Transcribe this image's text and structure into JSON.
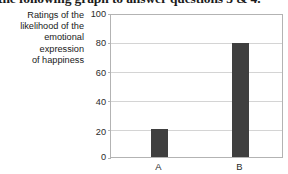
{
  "header": {
    "clipped_text": "the following graph to answer questions 3 & 4."
  },
  "chart_data": {
    "type": "bar",
    "title": "",
    "subtitle": "",
    "xlabel": "",
    "ylabel": "Ratings of the likelihood of the emotional expression of happiness",
    "ylabel_lines": [
      "Ratings of the",
      "likelihood of the",
      "emotional",
      "expression",
      "of happiness"
    ],
    "categories": [
      "A",
      "B"
    ],
    "values": [
      20,
      80
    ],
    "ylim": [
      0,
      100
    ],
    "yticks": [
      0,
      20,
      40,
      60,
      80,
      100
    ],
    "ytick_labels": [
      "0",
      "20",
      "40",
      "60",
      "80",
      "100"
    ],
    "grid": true,
    "legend": false,
    "bar_color": "#3f3f3f",
    "grid_color": "#d4d4d4",
    "frame_color": "#b3b3b3",
    "background_color": "#ffffff"
  }
}
